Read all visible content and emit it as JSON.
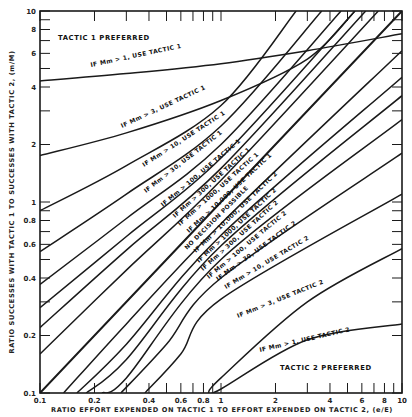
{
  "chart_data": {
    "type": "line",
    "title": "",
    "xlabel": "RATIO EFFORT EXPENDED ON TACTIC 1 TO EFFORT EXPENDED ON TACTIC 2, (e/E)",
    "ylabel": "RATIO SUCCESSES WITH TACTIC 1 TO SUCCESSES WITH TACTIC 2, (m/M)",
    "xscale": "log",
    "yscale": "log",
    "xlim": [
      0.1,
      10
    ],
    "ylim": [
      0.1,
      10
    ],
    "grid": false,
    "x_ticks": [
      0.1,
      0.2,
      0.4,
      0.6,
      0.8,
      1,
      2,
      4,
      6,
      8,
      10
    ],
    "x_tick_labels": [
      "0.1",
      "0.2",
      "0.4",
      "0.6",
      "0.8",
      "1",
      "2",
      "4",
      "6",
      "8",
      "10"
    ],
    "y_ticks": [
      0.1,
      0.2,
      0.4,
      0.6,
      0.8,
      1,
      2,
      4,
      6,
      8,
      10
    ],
    "y_tick_labels": [
      "0.1",
      "0.2",
      "0.4",
      "0.6",
      "0.8",
      "1",
      "2",
      "4",
      "6",
      "8",
      "10"
    ],
    "region_labels": [
      {
        "text": "TACTIC 1 PREFERRED",
        "position": "upper-left"
      },
      {
        "text": "TACTIC 2 PREFERRED",
        "position": "lower-right"
      }
    ],
    "series": [
      {
        "name": "IF Mm > 1, USE TACTIC 1",
        "x": [
          0.1,
          0.3,
          1,
          3,
          10
        ],
        "y": [
          4.3,
          4.7,
          5.3,
          6.2,
          7.6
        ]
      },
      {
        "name": "IF Mm > 3, USE TACTIC 1",
        "x": [
          0.1,
          0.3,
          1,
          3,
          5.5
        ],
        "y": [
          1.75,
          2.3,
          3.4,
          5.6,
          10
        ]
      },
      {
        "name": "IF Mm > 10, USE TACTIC 1",
        "x": [
          0.1,
          0.3,
          1,
          2.6
        ],
        "y": [
          0.9,
          1.55,
          3.2,
          10
        ]
      },
      {
        "name": "IF Mm > 30, USE TACTIC 1",
        "x": [
          0.1,
          0.3,
          1,
          3.6
        ],
        "y": [
          0.55,
          1.1,
          2.5,
          10
        ]
      },
      {
        "name": "IF Mm > 100, USE TACTIC 1",
        "x": [
          0.1,
          0.3,
          1,
          4.6
        ],
        "y": [
          0.37,
          0.82,
          2.0,
          10
        ]
      },
      {
        "name": "IF Mm > 300, USE TACTIC 1",
        "x": [
          0.1,
          0.3,
          1,
          5.5
        ],
        "y": [
          0.28,
          0.66,
          1.7,
          10
        ]
      },
      {
        "name": "IF Mm > 1000, USE TACTIC 1",
        "x": [
          0.1,
          0.3,
          1,
          6.3
        ],
        "y": [
          0.22,
          0.56,
          1.5,
          10
        ]
      },
      {
        "name": "IF Mm > 10,000, USE TACTIC 1",
        "x": [
          0.1,
          0.3,
          1,
          7.4
        ],
        "y": [
          0.16,
          0.44,
          1.3,
          10
        ]
      },
      {
        "name": "NO DECISION POSSIBLE",
        "x": [
          0.1,
          1,
          10
        ],
        "y": [
          0.1,
          1,
          10
        ]
      },
      {
        "name": "IF Mm > 10,000, USE TACTIC 2",
        "x": [
          0.135,
          0.3,
          1,
          10
        ],
        "y": [
          0.1,
          0.23,
          0.77,
          6.2
        ]
      },
      {
        "name": "IF Mm > 1000, USE TACTIC 2",
        "x": [
          0.16,
          0.3,
          1,
          10
        ],
        "y": [
          0.1,
          0.18,
          0.67,
          4.5
        ]
      },
      {
        "name": "IF Mm > 300, USE TACTIC 2",
        "x": [
          0.18,
          0.3,
          1,
          10
        ],
        "y": [
          0.1,
          0.15,
          0.59,
          3.6
        ]
      },
      {
        "name": "IF Mm > 100, USE TACTIC 2",
        "x": [
          0.22,
          0.3,
          1,
          10
        ],
        "y": [
          0.1,
          0.12,
          0.5,
          2.7
        ]
      },
      {
        "name": "IF Mm > 30, USE TACTIC 2",
        "x": [
          0.28,
          0.5,
          1,
          10
        ],
        "y": [
          0.1,
          0.18,
          0.4,
          1.8
        ]
      },
      {
        "name": "IF Mm > 10, USE TACTIC 2",
        "x": [
          0.38,
          0.6,
          1,
          10
        ],
        "y": [
          0.1,
          0.16,
          0.31,
          1.1
        ]
      },
      {
        "name": "IF Mm > 3, USE TACTIC 2",
        "x": [
          0.85,
          1,
          3,
          10
        ],
        "y": [
          0.1,
          0.12,
          0.3,
          0.57
        ]
      },
      {
        "name": "IF Mm > 1, USE TACTIC 2",
        "x": [
          0.85,
          1,
          3,
          10
        ],
        "y": [
          0.1,
          0.105,
          0.19,
          0.23
        ]
      }
    ]
  },
  "labels": {
    "region_t1": "TACTIC 1 PREFERRED",
    "region_t2": "TACTIC 2 PREFERRED",
    "xlabel": "RATIO EFFORT EXPENDED ON TACTIC 1 TO EFFORT EXPENDED ON TACTIC 2, (e/E)",
    "ylabel": "RATIO SUCCESSES WITH TACTIC 1 TO SUCCESSES WITH TACTIC 2, (m/M)",
    "t1_1": "IF Mm > 1, USE TACTIC 1",
    "t1_3": "IF Mm > 3, USE TACTIC 1",
    "t1_10": "IF Mm > 10, USE TACTIC 1",
    "t1_30": "IF Mm > 30, USE TACTIC 1",
    "t1_100": "IF Mm > 100, USE TACTIC 1",
    "t1_300": "IF Mm > 300, USE TACTIC 1",
    "t1_1000": "IF Mm > 1000, USE TACTIC 1",
    "t1_10000": "IF Mm > 10,000, USE TACTIC 1",
    "nodecision": "NO DECISION POSSIBLE",
    "t2_10000": "IF Mm > 10,000, USE TACTIC 2",
    "t2_1000": "IF Mm > 1000, USE TACTIC 2",
    "t2_300": "IF Mm > 300, USE TACTIC 2",
    "t2_100": "IF Mm > 100, USE TACTIC 2",
    "t2_30": "IF Mm > 30, USE TACTIC 2",
    "t2_10": "IF Mm > 10, USE TACTIC 2",
    "t2_3": "IF Mm > 3, USE TACTIC 2",
    "t2_1": "IF Mm > 1, USE TACTIC 2"
  },
  "style": {
    "line_color": "#1a1a1a",
    "background": "#ffffff"
  }
}
